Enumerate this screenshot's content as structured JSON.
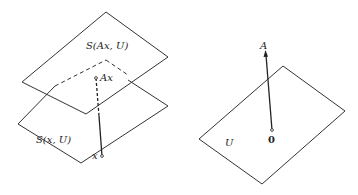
{
  "left_figure": {
    "upper_plane_label": "S(Ax, U)",
    "lower_plane_label": "S(x, U)",
    "point_upper_label": "Ax",
    "point_lower_label": "x"
  },
  "right_figure": {
    "plane_label": "U",
    "origin_label": "0",
    "vector_label": "A"
  },
  "colors": {
    "stroke": "#333333",
    "background": "#ffffff"
  }
}
